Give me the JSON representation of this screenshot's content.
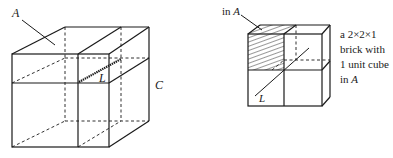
{
  "left_figure": {
    "label_A": "A",
    "label_L": "L",
    "label_C": "C"
  },
  "right_figure": {
    "pointer_label_prefix": "in ",
    "pointer_label_var": "A",
    "label_L": "L",
    "caption": [
      {
        "text": "a 2×2×1",
        "var": ""
      },
      {
        "text": "brick with",
        "var": ""
      },
      {
        "text": "1 unit cube",
        "var": ""
      },
      {
        "text": "in ",
        "var": "A"
      }
    ]
  },
  "colors": {
    "line": "#1a1a1a",
    "background": "#ffffff"
  }
}
